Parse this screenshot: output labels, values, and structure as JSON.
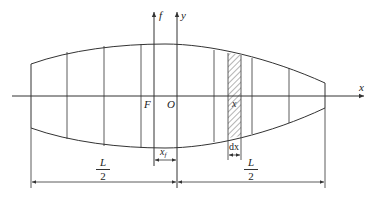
{
  "diagram": {
    "axes": {
      "x_label": "x",
      "y_label": "y",
      "f_label": "f"
    },
    "points": {
      "focus_label": "F",
      "origin_label": "O"
    },
    "strip": {
      "position_label": "x",
      "width_label": "dx"
    },
    "dimensions": {
      "offset_label": "x",
      "offset_subscript": "f",
      "half_length_num": "L",
      "half_length_den": "2"
    },
    "colors": {
      "stroke": "#333333",
      "background": "#ffffff"
    }
  }
}
